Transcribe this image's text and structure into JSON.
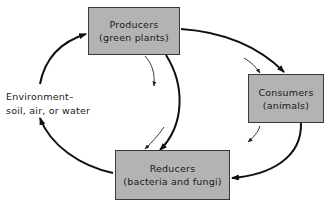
{
  "diagram": {
    "type": "cycle",
    "nodes": {
      "producers": {
        "title": "Producers",
        "subtitle": "(green plants)"
      },
      "consumers": {
        "title": "Consumers",
        "subtitle": "(animals)"
      },
      "reducers": {
        "title": "Reducers",
        "subtitle": "(bacteria and fungi)"
      },
      "environment": {
        "line1": "Environment–",
        "line2": "soil, air, or water"
      }
    },
    "edges": [
      {
        "from": "producers",
        "to": "consumers",
        "style": "thick"
      },
      {
        "from": "consumers",
        "to": "reducers",
        "style": "thick"
      },
      {
        "from": "producers",
        "to": "reducers",
        "style": "thick"
      },
      {
        "from": "reducers",
        "to": "environment",
        "style": "thick"
      },
      {
        "from": "environment",
        "to": "producers",
        "style": "thick"
      }
    ],
    "colors": {
      "box_fill": "#b3b3b3",
      "box_border": "#3a3a3a",
      "arrow": "#111111"
    }
  }
}
